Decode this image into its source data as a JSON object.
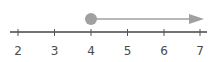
{
  "diagram": {
    "type": "number-line",
    "ticks": [
      "2",
      "3",
      "4",
      "5",
      "6",
      "7"
    ],
    "endpoint": {
      "value": "4",
      "style": "closed-circle"
    },
    "ray_direction": "right",
    "colors": {
      "axis": "#444444",
      "ray": "#a0a0a0",
      "point": "#a0a0a0",
      "label": "#4a4a4a"
    }
  }
}
